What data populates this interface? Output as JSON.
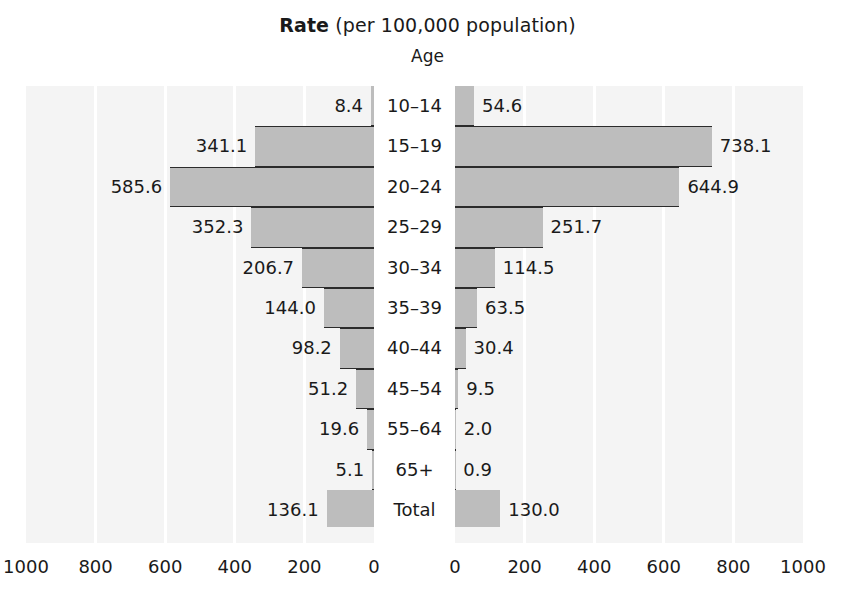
{
  "title": {
    "bold": "Rate",
    "rest": " (per 100,000 population)"
  },
  "subtitle": "Age",
  "chart_data": {
    "type": "bar",
    "title": "Rate (per 100,000 population)",
    "subtitle": "Age",
    "orientation": "horizontal",
    "layout": "population-pyramid",
    "xlabel": "",
    "ylabel": "Age",
    "xlim": [
      0,
      1000
    ],
    "grid": true,
    "legend_position": "none",
    "categories": [
      "10–14",
      "15–19",
      "20–24",
      "25–29",
      "30–34",
      "35–39",
      "40–44",
      "45–54",
      "55–64",
      "65+",
      "Total"
    ],
    "ticks_left": [
      "1000",
      "800",
      "600",
      "400",
      "200",
      "0"
    ],
    "ticks_right": [
      "0",
      "200",
      "400",
      "600",
      "800",
      "1000"
    ],
    "series": [
      {
        "name": "left",
        "side": "left",
        "values": [
          8.4,
          341.1,
          585.6,
          352.3,
          206.7,
          144.0,
          98.2,
          51.2,
          19.6,
          5.1,
          136.1
        ],
        "labels": [
          "8.4",
          "341.1",
          "585.6",
          "352.3",
          "206.7",
          "144.0",
          "98.2",
          "51.2",
          "19.6",
          "5.1",
          "136.1"
        ]
      },
      {
        "name": "right",
        "side": "right",
        "values": [
          54.6,
          738.1,
          644.9,
          251.7,
          114.5,
          63.5,
          30.4,
          9.5,
          2.0,
          0.9,
          130.0
        ],
        "labels": [
          "54.6",
          "738.1",
          "644.9",
          "251.7",
          "114.5",
          "63.5",
          "30.4",
          "9.5",
          "2.0",
          "0.9",
          "130.0"
        ]
      }
    ],
    "colors": {
      "bar_fill": "#bdbdbd",
      "bar_edge": "#2b2b2b",
      "panel_background": "#f4f4f4",
      "gridline": "#ffffff",
      "text": "#1a1a1a"
    }
  }
}
